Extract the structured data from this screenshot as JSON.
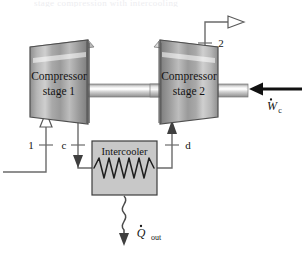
{
  "figure": {
    "ghost_top_text": "stage compression with intercooling",
    "background_color": "#ffffff",
    "line_color": "#4a4a4a",
    "text_color": "#1a1a1a",
    "intercooler_fill": "#c8c8c8",
    "intercooler_border": "#3c3c3c",
    "metal_light": "#f2f2f2",
    "metal_mid": "#a8a8a8",
    "metal_dark": "#6e6e6e",
    "shaft_highlight": "#fafafa",
    "work_arrow_color": "#111111"
  },
  "components": {
    "compressor_stage_1": {
      "label_line_1": "Compressor",
      "label_line_2": "stage 1"
    },
    "compressor_stage_2": {
      "label_line_1": "Compressor",
      "label_line_2": "stage 2"
    },
    "intercooler": {
      "label": "Intercooler"
    },
    "shaft": {
      "label": "drive shaft"
    }
  },
  "state_points": [
    {
      "id": "1",
      "label": "1",
      "description": "compressor stage 1 inlet"
    },
    {
      "id": "c",
      "label": "c",
      "description": "stage 1 exit to intercooler"
    },
    {
      "id": "d",
      "label": "d",
      "description": "intercooler exit to stage 2"
    },
    {
      "id": "2",
      "label": "2",
      "description": "compressor stage 2 exit"
    }
  ],
  "energy_flows": {
    "work_input": {
      "symbol": "W",
      "subscript": "c",
      "display": "Wc",
      "description": "compressor work input"
    },
    "heat_rejected": {
      "symbol": "Q",
      "subscript": "out",
      "display": "Qout",
      "description": "heat rejected from intercooler"
    }
  }
}
